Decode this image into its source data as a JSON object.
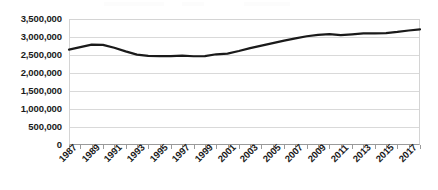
{
  "chart_data": {
    "type": "line",
    "title": "",
    "subtitle": "",
    "xlabel": "",
    "ylabel": "",
    "grid": true,
    "legend": false,
    "legend_position": "none",
    "line_color": "#1a1a1a",
    "x": [
      1987,
      1988,
      1989,
      1990,
      1991,
      1992,
      1993,
      1994,
      1995,
      1996,
      1997,
      1998,
      1999,
      2000,
      2001,
      2002,
      2003,
      2004,
      2005,
      2006,
      2007,
      2008,
      2009,
      2010,
      2011,
      2012,
      2013,
      2014,
      2015,
      2016,
      2017,
      2018
    ],
    "x_tick_labels": [
      "1987",
      "1989",
      "1991",
      "1993",
      "1995",
      "1997",
      "1999",
      "2001",
      "2003",
      "2005",
      "2007",
      "2009",
      "2011",
      "2013",
      "2015",
      "2017"
    ],
    "y_tick_labels": [
      "3,500,000",
      "3,000,000",
      "2,500,000",
      "2,000,000",
      "1,500,000",
      "1,000,000",
      "500,000",
      "0"
    ],
    "y_ticks": [
      3500000,
      3000000,
      2500000,
      2000000,
      1500000,
      1000000,
      500000,
      0
    ],
    "ylim": [
      0,
      3500000
    ],
    "xlim": [
      1987,
      2018
    ],
    "values": [
      2650000,
      2720000,
      2790000,
      2780000,
      2700000,
      2600000,
      2510000,
      2475000,
      2470000,
      2470000,
      2480000,
      2465000,
      2470000,
      2520000,
      2540000,
      2610000,
      2690000,
      2760000,
      2830000,
      2900000,
      2960000,
      3020000,
      3060000,
      3080000,
      3050000,
      3075000,
      3100000,
      3100000,
      3110000,
      3140000,
      3180000,
      3210000
    ]
  }
}
